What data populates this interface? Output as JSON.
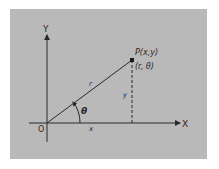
{
  "diagram": {
    "axes": {
      "x_label": "X",
      "y_label": "Y",
      "origin_label": "O"
    },
    "point": {
      "cartesian_label": "P(x,y)",
      "polar_label": "(r, θ)"
    },
    "segments": {
      "radius_label": "r",
      "x_label": "x",
      "y_label": "y",
      "angle_label": "θ"
    },
    "colors": {
      "background": "#b9b9b9",
      "line": "#2a2a2a",
      "page": "#ffffff"
    }
  }
}
